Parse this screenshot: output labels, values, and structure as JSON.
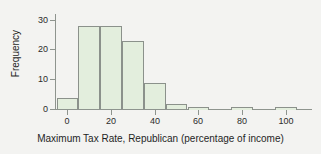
{
  "chart_data": {
    "type": "bar",
    "title": "",
    "subtitle": "",
    "xlabel": "Maximum Tax Rate, Republican (percentage of income)",
    "ylabel": "Frequency",
    "bin_width": 10,
    "bin_starts": [
      -5,
      5,
      15,
      25,
      35,
      45,
      55,
      65,
      75,
      85,
      95
    ],
    "categories": [
      "-5 to 5",
      "5 to 15",
      "15 to 25",
      "25 to 35",
      "35 to 45",
      "45 to 55",
      "55 to 65",
      "65 to 75",
      "75 to 85",
      "85 to 95",
      "95 to 105"
    ],
    "values": [
      4,
      28,
      28,
      23,
      9,
      2,
      1,
      0,
      1,
      0,
      1
    ],
    "xlim": [
      -12,
      115
    ],
    "ylim": [
      0,
      32
    ],
    "xticks": [
      0,
      20,
      40,
      60,
      80,
      100
    ],
    "xtick_labels": [
      "0",
      "20",
      "40",
      "60",
      "80",
      "100"
    ],
    "yticks": [
      0,
      10,
      20,
      30
    ],
    "ytick_labels": [
      "0",
      "10",
      "20",
      "30"
    ],
    "grid": false,
    "legend": false,
    "legend_position": "none",
    "bar_fill_color": "#e3eedd",
    "bar_border_color": "#8b918b",
    "axis_color": "#8e948e",
    "background_color": "#f3f3f1",
    "text_color": "#1f1f1f"
  }
}
